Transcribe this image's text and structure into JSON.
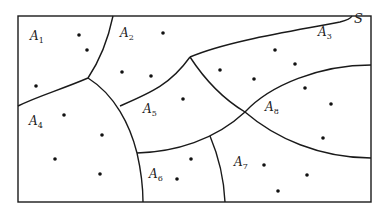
{
  "diagram": {
    "set_label": "S",
    "colors": {
      "line": "#1a1a1a",
      "dot": "#111111",
      "background": "#ffffff"
    },
    "regions": [
      {
        "id": "A1",
        "letter": "A",
        "index": "1",
        "x": 30,
        "y": 30
      },
      {
        "id": "A2",
        "letter": "A",
        "index": "2",
        "x": 120,
        "y": 27
      },
      {
        "id": "A3",
        "letter": "A",
        "index": "3",
        "x": 318,
        "y": 26
      },
      {
        "id": "A4",
        "letter": "A",
        "index": "4",
        "x": 29,
        "y": 115
      },
      {
        "id": "A5",
        "letter": "A",
        "index": "5",
        "x": 143,
        "y": 103
      },
      {
        "id": "A6",
        "letter": "A",
        "index": "6",
        "x": 149,
        "y": 168
      },
      {
        "id": "A7",
        "letter": "A",
        "index": "7",
        "x": 234,
        "y": 156
      },
      {
        "id": "A8",
        "letter": "A",
        "index": "8",
        "x": 265,
        "y": 101
      }
    ],
    "points": [
      [
        79,
        35
      ],
      [
        87,
        50
      ],
      [
        36,
        86
      ],
      [
        163,
        33
      ],
      [
        122,
        72
      ],
      [
        151,
        76
      ],
      [
        183,
        99
      ],
      [
        275,
        50
      ],
      [
        295,
        64
      ],
      [
        254,
        79
      ],
      [
        220,
        70
      ],
      [
        305,
        88
      ],
      [
        331,
        104
      ],
      [
        323,
        138
      ],
      [
        64,
        115
      ],
      [
        102,
        135
      ],
      [
        55,
        159
      ],
      [
        100,
        174
      ],
      [
        191,
        159
      ],
      [
        177,
        179
      ],
      [
        264,
        165
      ],
      [
        307,
        175
      ],
      [
        278,
        191
      ]
    ]
  }
}
